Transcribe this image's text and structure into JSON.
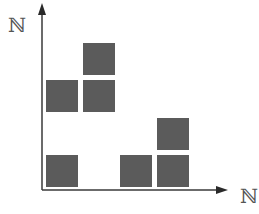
{
  "diagram": {
    "y_axis_label": "ℕ",
    "x_axis_label": "ℕ",
    "cell_color": "#5b5b5b",
    "axis_color": "#3a3a3a",
    "grid_origin_px": [
      46,
      187
    ],
    "cell_step_px": [
      37,
      37.5
    ],
    "cells": [
      {
        "x": 1,
        "y": 1
      },
      {
        "x": 1,
        "y": 3
      },
      {
        "x": 2,
        "y": 3
      },
      {
        "x": 2,
        "y": 4
      },
      {
        "x": 3,
        "y": 1
      },
      {
        "x": 4,
        "y": 1
      },
      {
        "x": 4,
        "y": 2
      }
    ]
  }
}
